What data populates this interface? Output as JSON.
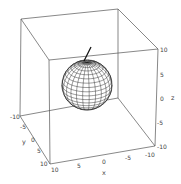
{
  "chart_data": {
    "type": "3d-surface",
    "title": "",
    "xlabel": "x",
    "ylabel": "y",
    "zlabel": "z",
    "xlim": [
      -10,
      10
    ],
    "ylim": [
      -10,
      10
    ],
    "zlim": [
      -10,
      10
    ],
    "x_ticks": [
      "10",
      "5",
      "0",
      "-5",
      "-10"
    ],
    "y_ticks": [
      "-10",
      "-5",
      "0",
      "5",
      "10"
    ],
    "z_ticks": [
      "10",
      "5",
      "0",
      "-5",
      "-10"
    ],
    "surfaces": [
      {
        "name": "sphere",
        "center": [
          0,
          0,
          0
        ],
        "radius": 5,
        "style": "wireframe mesh"
      }
    ],
    "lines": [
      {
        "name": "segment",
        "from": [
          0,
          0,
          5
        ],
        "to": [
          0,
          0,
          8
        ]
      }
    ],
    "box": true,
    "grid": false,
    "legend": null
  }
}
